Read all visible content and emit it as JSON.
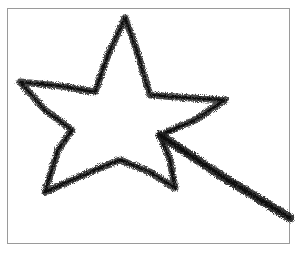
{
  "image": {
    "subject": "tinsel star with trailing tail",
    "description": "A hand-shaped star outline made of dark fuzzy tinsel/pipe cleaner on a white background, with a straight tail extending to the lower right",
    "colors": {
      "background": "#ffffff",
      "frame": "#9a9a9a",
      "tinsel_dark": "#1a1a1a",
      "tinsel_mid": "#555555"
    }
  }
}
